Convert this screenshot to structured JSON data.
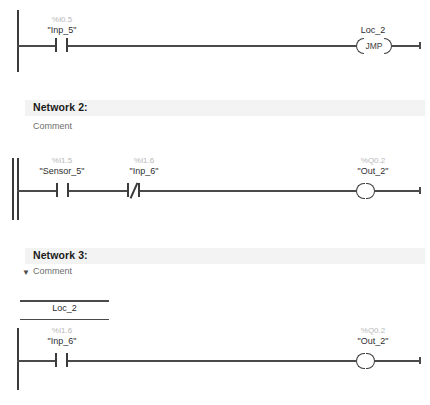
{
  "app": {
    "kind": "ladder-logic-editor",
    "colors": {
      "header_bar": "#f3f3f3",
      "rail": "#3b3b3b",
      "wire": "#4a4a4a",
      "address_text": "#b9b9b9",
      "symbol_text": "#2d2d2d",
      "comment_text": "#6e6e6e"
    }
  },
  "networks": [
    {
      "id": "network-1",
      "title": "",
      "comment": "",
      "header_visible": false,
      "rung": {
        "contacts": [
          {
            "type": "no",
            "address": "%I0.5",
            "symbol": "\"Inp_5\""
          }
        ],
        "output": {
          "type": "jmp-coil",
          "label": "JMP",
          "symbol": "Loc_2"
        }
      }
    },
    {
      "id": "network-2",
      "title": "Network 2:",
      "comment": "Comment",
      "header_visible": true,
      "collapsible": false,
      "rung": {
        "contacts": [
          {
            "type": "no",
            "address": "%I1.5",
            "symbol": "\"Sensor_5\""
          },
          {
            "type": "nc",
            "address": "%I1.6",
            "symbol": "\"Inp_6\""
          }
        ],
        "output": {
          "type": "coil",
          "address": "%Q0.2",
          "symbol": "\"Out_2\""
        }
      }
    },
    {
      "id": "network-3",
      "title": "Network 3:",
      "comment": "Comment",
      "header_visible": true,
      "collapsible": true,
      "collapse_glyph": "▼",
      "jump_destination": "Loc_2",
      "rung": {
        "contacts": [
          {
            "type": "no",
            "address": "%I1.6",
            "symbol": "\"Inp_6\""
          }
        ],
        "output": {
          "type": "coil",
          "address": "%Q0.2",
          "symbol": "\"Out_2\""
        }
      }
    }
  ]
}
